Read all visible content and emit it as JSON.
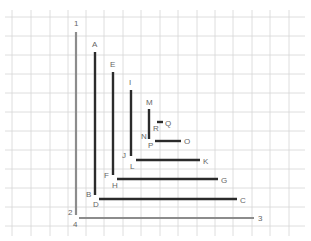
{
  "diagram": {
    "grid": {
      "color": "#d6d6d6",
      "vertical_x": [
        12,
        31,
        50,
        68,
        86,
        104,
        123,
        141,
        160,
        178,
        197,
        215,
        233,
        252,
        270,
        289
      ],
      "horizontal_y": [
        17,
        36,
        55,
        74,
        93,
        112,
        131,
        150,
        169,
        188,
        207,
        226
      ],
      "x_range": [
        5,
        305
      ],
      "y_range": [
        10,
        236
      ]
    },
    "colors": {
      "dark_line": "#2b2b2b",
      "gray_line": "#8c8c8c",
      "label": "#666666"
    },
    "segments": [
      {
        "id": "1-2",
        "kind": "gray",
        "x1": 76,
        "y1": 32,
        "x2": 76,
        "y2": 215
      },
      {
        "id": "4-3",
        "kind": "gray",
        "x1": 79,
        "y1": 218,
        "x2": 254,
        "y2": 218
      },
      {
        "id": "A-B",
        "kind": "dark",
        "x1": 95,
        "y1": 52,
        "x2": 95,
        "y2": 195
      },
      {
        "id": "D-C",
        "kind": "dark",
        "x1": 99,
        "y1": 199,
        "x2": 237,
        "y2": 199
      },
      {
        "id": "E-F",
        "kind": "dark",
        "x1": 113,
        "y1": 72,
        "x2": 113,
        "y2": 175
      },
      {
        "id": "H-G",
        "kind": "dark",
        "x1": 117,
        "y1": 179,
        "x2": 218,
        "y2": 179
      },
      {
        "id": "I-J",
        "kind": "dark",
        "x1": 131,
        "y1": 90,
        "x2": 131,
        "y2": 156
      },
      {
        "id": "L-K",
        "kind": "dark",
        "x1": 136,
        "y1": 160,
        "x2": 200,
        "y2": 160
      },
      {
        "id": "M-N",
        "kind": "dark",
        "x1": 149,
        "y1": 109,
        "x2": 149,
        "y2": 139
      },
      {
        "id": "P-O",
        "kind": "dark",
        "x1": 155,
        "y1": 141,
        "x2": 181,
        "y2": 141
      },
      {
        "id": "R-Q",
        "kind": "dark",
        "x1": 157,
        "y1": 122,
        "x2": 163,
        "y2": 122
      }
    ],
    "labels": [
      {
        "text": "1",
        "x": 74,
        "y": 26
      },
      {
        "text": "2",
        "x": 68,
        "y": 215
      },
      {
        "text": "3",
        "x": 258,
        "y": 221
      },
      {
        "text": "4",
        "x": 73,
        "y": 227
      },
      {
        "text": "A",
        "x": 92,
        "y": 47
      },
      {
        "text": "B",
        "x": 86,
        "y": 197
      },
      {
        "text": "C",
        "x": 240,
        "y": 203
      },
      {
        "text": "D",
        "x": 93,
        "y": 207
      },
      {
        "text": "E",
        "x": 110,
        "y": 67
      },
      {
        "text": "F",
        "x": 104,
        "y": 178
      },
      {
        "text": "G",
        "x": 221,
        "y": 183
      },
      {
        "text": "H",
        "x": 112,
        "y": 188
      },
      {
        "text": "I",
        "x": 129,
        "y": 85
      },
      {
        "text": "J",
        "x": 122,
        "y": 158
      },
      {
        "text": "K",
        "x": 203,
        "y": 164
      },
      {
        "text": "L",
        "x": 130,
        "y": 169
      },
      {
        "text": "M",
        "x": 146,
        "y": 105
      },
      {
        "text": "N",
        "x": 141,
        "y": 139
      },
      {
        "text": "O",
        "x": 184,
        "y": 144
      },
      {
        "text": "P",
        "x": 148,
        "y": 148
      },
      {
        "text": "Q",
        "x": 165,
        "y": 126
      },
      {
        "text": "R",
        "x": 153,
        "y": 131
      }
    ]
  }
}
